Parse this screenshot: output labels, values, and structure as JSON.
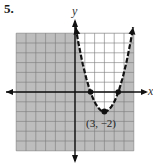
{
  "problem": {
    "number": "5."
  },
  "chart_data": {
    "type": "line",
    "title": "",
    "xlabel": "x",
    "ylabel": "y",
    "xlim": [
      -6,
      6
    ],
    "ylim": [
      -6,
      6
    ],
    "grid": true,
    "series": [
      {
        "name": "y = (x - 3)^2 - 2",
        "style": "dashed",
        "equation": "y = (x - 3)^2 - 2",
        "vertex": [
          3,
          -2
        ],
        "x_intercepts": [
          1.59,
          4.41
        ],
        "shading": "outside parabola (y < (x-3)^2 - 2)"
      }
    ],
    "annotations": [
      {
        "text": "(3, −2)",
        "x": 3,
        "y": -2
      }
    ],
    "colors": {
      "shade": "#bdbdbd",
      "grid": "#7a7a7a",
      "curve": "#111111",
      "axis": "#111111"
    }
  },
  "labels": {
    "x_axis": "x",
    "y_axis": "y",
    "vertex": "(3, −2)"
  }
}
